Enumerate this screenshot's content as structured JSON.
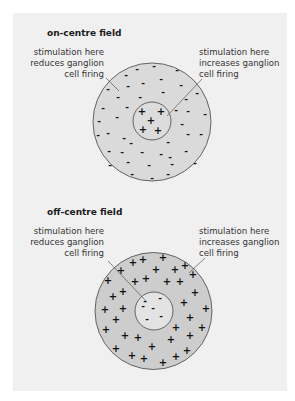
{
  "colors": {
    "panel_bg": "#f0f0f0",
    "on_surround_fill": "#dadada",
    "on_center_fill": "#dcdcdc",
    "off_surround_fill": "#cdcdcd",
    "off_center_fill": "#e3e3e3",
    "outline": "#555555",
    "text": "#333333"
  },
  "fields": [
    {
      "id": "on-centre",
      "title": "on-centre field",
      "left_label": [
        "stimulation here",
        "reduces ganglion",
        "cell firing"
      ],
      "right_label": [
        "stimulation here",
        "increases ganglion",
        "cell firing"
      ],
      "center_symbol": "+",
      "surround_symbol": "-"
    },
    {
      "id": "off-centre",
      "title": "off-centre field",
      "left_label": [
        "stimulation here",
        "reduces ganglion",
        "cell firing"
      ],
      "right_label": [
        "stimulation here",
        "increases ganglion",
        "cell firing"
      ],
      "center_symbol": "-",
      "surround_symbol": "+"
    }
  ]
}
